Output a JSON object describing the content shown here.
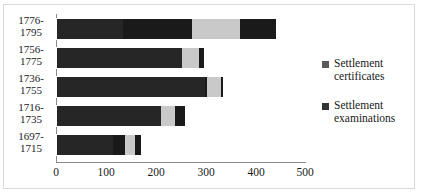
{
  "chart_data": {
    "type": "bar",
    "orientation": "horizontal",
    "stacked": true,
    "title": "",
    "xlabel": "",
    "ylabel": "",
    "categories": [
      "1776-\n1795",
      "1756-\n1775",
      "1736-\n1755",
      "1716-\n1735",
      "1697-\n1715"
    ],
    "category_lines": [
      [
        "1776-",
        "1795"
      ],
      [
        "1756-",
        "1775"
      ],
      [
        "1736-",
        "1755"
      ],
      [
        "1716-",
        "1735"
      ],
      [
        "1697-",
        "1715"
      ]
    ],
    "series": [
      {
        "name": "Settlement examinations",
        "color": "#262626",
        "values": [
          133,
          270,
          300,
          215,
          116
        ]
      },
      {
        "name": "Settlement certificates",
        "color": "#1a1a1a",
        "values": [
          310,
          30,
          37,
          46,
          56
        ]
      }
    ],
    "totals": [
      443,
      300,
      337,
      261,
      172
    ],
    "highlight_color": "#c9c9c9",
    "xlim": [
      0,
      500
    ],
    "xticks": [
      0,
      100,
      200,
      300,
      400,
      500
    ],
    "xtick_labels": [
      "0",
      "100",
      "200",
      "300",
      "400",
      "500"
    ],
    "grid": false,
    "legend_position": "right",
    "legend": [
      {
        "label_lines": [
          "Settlement",
          "certificates"
        ],
        "color": "#595959"
      },
      {
        "label_lines": [
          "Settlement",
          "examinations"
        ],
        "color": "#333333"
      }
    ]
  },
  "legend": {
    "items": [
      {
        "line1": "Settlement",
        "line2": "certificates"
      },
      {
        "line1": "Settlement",
        "line2": "examinations"
      }
    ]
  },
  "axis": {
    "x_ticks": [
      "0",
      "100",
      "200",
      "300",
      "400",
      "500"
    ],
    "y_categories": [
      {
        "line1": "1776-",
        "line2": "1795"
      },
      {
        "line1": "1756-",
        "line2": "1775"
      },
      {
        "line1": "1736-",
        "line2": "1755"
      },
      {
        "line1": "1716-",
        "line2": "1735"
      },
      {
        "line1": "1697-",
        "line2": "1715"
      }
    ]
  }
}
